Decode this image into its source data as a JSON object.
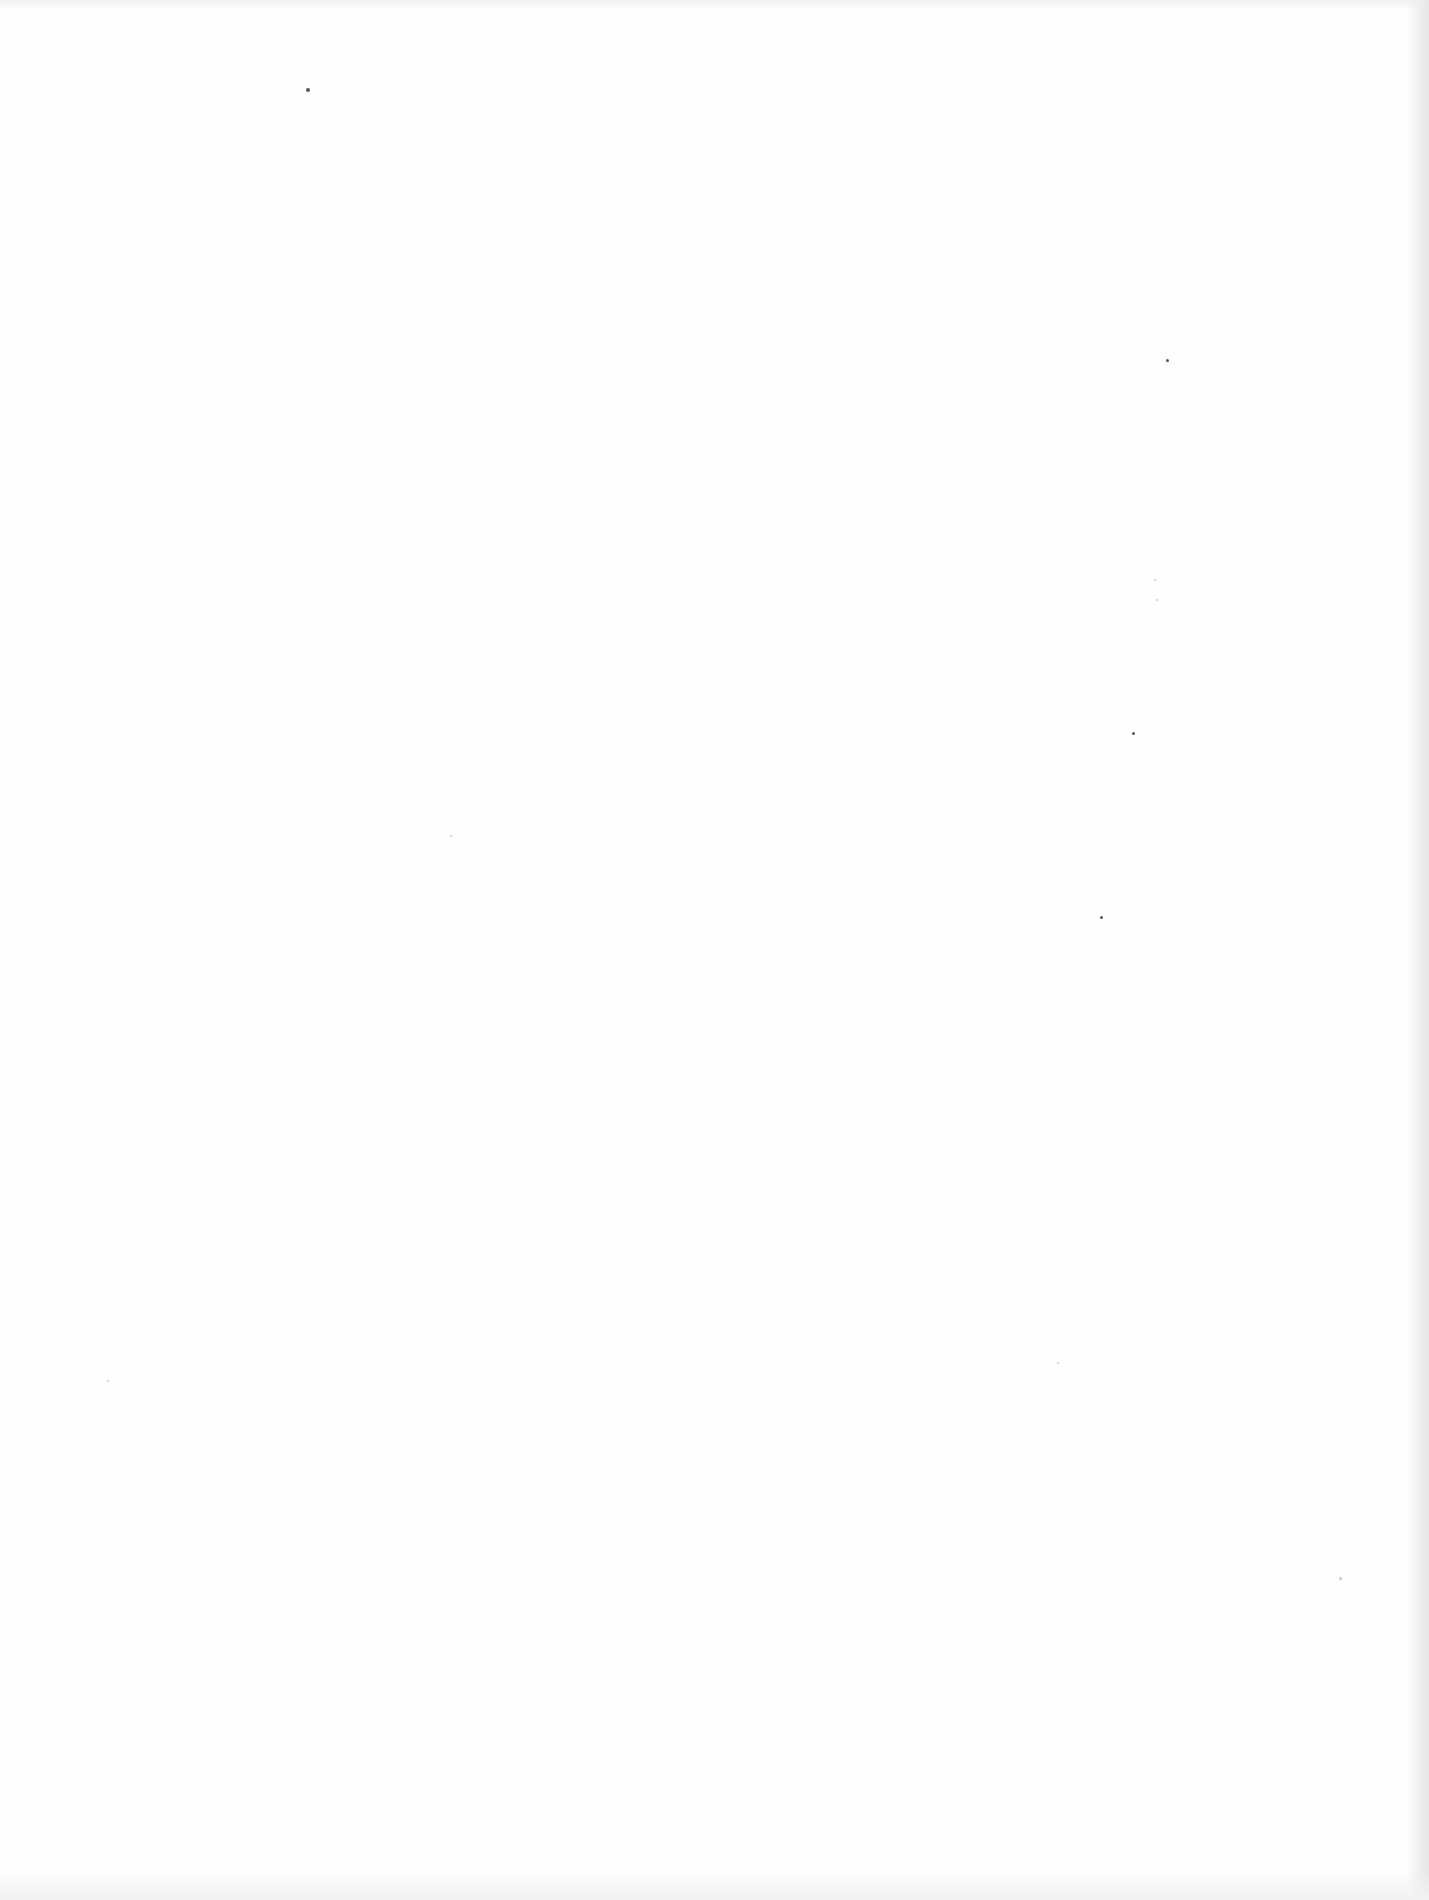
{
  "document": {
    "type": "scanned-page",
    "content": "",
    "text_blocks": []
  },
  "colors": {
    "paper": "#fefefe",
    "edge_shadow": "#e6e6e6"
  },
  "artifacts": {
    "specks": [
      {
        "x": 308,
        "y": 90,
        "r": 2,
        "tone": "dark"
      },
      {
        "x": 1167,
        "y": 360,
        "r": 1.5,
        "tone": "dark"
      },
      {
        "x": 1133,
        "y": 733,
        "r": 1.5,
        "tone": "dark"
      },
      {
        "x": 1101,
        "y": 917,
        "r": 1.5,
        "tone": "dark"
      },
      {
        "x": 451,
        "y": 836,
        "r": 1,
        "tone": "light"
      },
      {
        "x": 108,
        "y": 1381,
        "r": 1,
        "tone": "light"
      },
      {
        "x": 1058,
        "y": 1363,
        "r": 1,
        "tone": "light"
      },
      {
        "x": 1340,
        "y": 1578,
        "r": 1.5,
        "tone": "light"
      },
      {
        "x": 1155,
        "y": 580,
        "r": 1,
        "tone": "light"
      },
      {
        "x": 1157,
        "y": 600,
        "r": 1,
        "tone": "light"
      }
    ]
  }
}
